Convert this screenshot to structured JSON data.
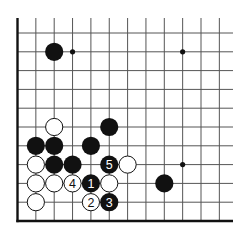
{
  "diagram": {
    "type": "go-board-fragment",
    "corner": "bottom-left",
    "columns_visible": 12,
    "rows_visible": 11,
    "colors": {
      "line": "#555555",
      "edge": "#111111",
      "black": "#111111",
      "white": "#ffffff",
      "background": "#ffffff"
    },
    "star_points": [
      {
        "col": 4,
        "row": 2
      },
      {
        "col": 10,
        "row": 2
      },
      {
        "col": 10,
        "row": 8
      }
    ],
    "stones": [
      {
        "color": "black",
        "col": 3,
        "row": 2,
        "label": ""
      },
      {
        "color": "white",
        "col": 3,
        "row": 6,
        "label": ""
      },
      {
        "color": "black",
        "col": 6,
        "row": 6,
        "label": ""
      },
      {
        "color": "black",
        "col": 2,
        "row": 7,
        "label": ""
      },
      {
        "color": "black",
        "col": 3,
        "row": 7,
        "label": ""
      },
      {
        "color": "black",
        "col": 5,
        "row": 7,
        "label": ""
      },
      {
        "color": "white",
        "col": 2,
        "row": 8,
        "label": ""
      },
      {
        "color": "black",
        "col": 3,
        "row": 8,
        "label": ""
      },
      {
        "color": "black",
        "col": 4,
        "row": 8,
        "label": ""
      },
      {
        "color": "black",
        "col": 6,
        "row": 8,
        "label": "5"
      },
      {
        "color": "white",
        "col": 7,
        "row": 8,
        "label": ""
      },
      {
        "color": "white",
        "col": 2,
        "row": 9,
        "label": ""
      },
      {
        "color": "white",
        "col": 3,
        "row": 9,
        "label": ""
      },
      {
        "color": "white",
        "col": 4,
        "row": 9,
        "label": "4"
      },
      {
        "color": "black",
        "col": 5,
        "row": 9,
        "label": "1"
      },
      {
        "color": "white",
        "col": 6,
        "row": 9,
        "label": ""
      },
      {
        "color": "black",
        "col": 9,
        "row": 9,
        "label": ""
      },
      {
        "color": "white",
        "col": 2,
        "row": 10,
        "label": ""
      },
      {
        "color": "white",
        "col": 5,
        "row": 10,
        "label": "2"
      },
      {
        "color": "black",
        "col": 6,
        "row": 10,
        "label": "3"
      }
    ]
  }
}
